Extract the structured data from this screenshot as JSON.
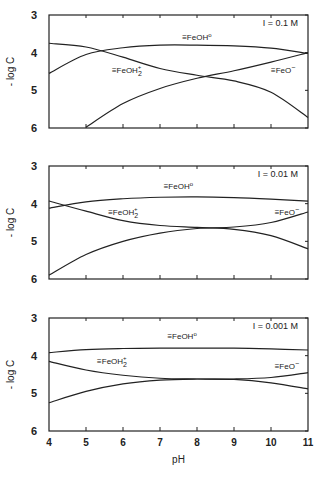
{
  "chart_data": [
    {
      "type": "line",
      "title": "I = 0.1 M",
      "xlabel": "pH",
      "ylabel": "- log C",
      "xlim": [
        4,
        11
      ],
      "ylim": [
        3,
        6
      ],
      "y_inverted": true,
      "yticks": [
        3,
        4,
        5,
        6
      ],
      "xticks": [
        4,
        5,
        6,
        7,
        8,
        9,
        10,
        11
      ],
      "grid": false,
      "x": [
        4,
        5,
        6,
        7,
        8,
        9,
        10,
        11
      ],
      "series": [
        {
          "name": "≡FeOH°",
          "values": [
            4.55,
            4.05,
            3.87,
            3.8,
            3.8,
            3.82,
            3.88,
            4.02
          ]
        },
        {
          "name": "≡FeOH2+",
          "values": [
            3.75,
            3.85,
            4.12,
            4.42,
            4.6,
            4.75,
            5.05,
            5.72
          ]
        },
        {
          "name": "≡FeO-",
          "values": [
            null,
            5.98,
            5.35,
            4.95,
            4.68,
            4.48,
            4.25,
            4.0
          ]
        }
      ],
      "labels": [
        {
          "text": "≡FeOH°",
          "x": 7.6,
          "y": 3.66
        },
        {
          "text": "≡FeOH2+",
          "x": 5.7,
          "y": 4.55
        },
        {
          "text": "≡FeO-",
          "x": 10.0,
          "y": 4.55
        }
      ]
    },
    {
      "type": "line",
      "title": "I = 0.01 M",
      "xlabel": "pH",
      "ylabel": "- log C",
      "xlim": [
        4,
        11
      ],
      "ylim": [
        3,
        6
      ],
      "y_inverted": true,
      "yticks": [
        3,
        4,
        5,
        6
      ],
      "xticks": [
        4,
        5,
        6,
        7,
        8,
        9,
        10,
        11
      ],
      "grid": false,
      "x": [
        4,
        5,
        6,
        7,
        8,
        9,
        10,
        11
      ],
      "series": [
        {
          "name": "≡FeOH°",
          "values": [
            4.12,
            3.95,
            3.87,
            3.83,
            3.82,
            3.84,
            3.88,
            3.93
          ]
        },
        {
          "name": "≡FeOH2+",
          "values": [
            3.93,
            4.2,
            4.45,
            4.58,
            4.63,
            4.68,
            4.85,
            5.2
          ]
        },
        {
          "name": "≡FeO-",
          "values": [
            5.9,
            5.35,
            5.0,
            4.78,
            4.66,
            4.62,
            4.5,
            4.22
          ]
        }
      ],
      "labels": [
        {
          "text": "≡FeOH°",
          "x": 7.1,
          "y": 3.6
        },
        {
          "text": "≡FeOH2+",
          "x": 5.6,
          "y": 4.3
        },
        {
          "text": "≡FeO-",
          "x": 10.1,
          "y": 4.3
        }
      ]
    },
    {
      "type": "line",
      "title": "I = 0.001 M",
      "xlabel": "pH",
      "ylabel": "- log C",
      "xlim": [
        4,
        11
      ],
      "ylim": [
        3,
        6
      ],
      "y_inverted": true,
      "yticks": [
        3,
        4,
        5,
        6
      ],
      "xticks": [
        4,
        5,
        6,
        7,
        8,
        9,
        10,
        11
      ],
      "xticklabels": [
        "4",
        "5",
        "6",
        "7",
        "8",
        "9",
        "10",
        "11"
      ],
      "grid": false,
      "x": [
        4,
        5,
        6,
        7,
        8,
        9,
        10,
        11
      ],
      "series": [
        {
          "name": "≡FeOH°",
          "values": [
            3.92,
            3.84,
            3.81,
            3.8,
            3.8,
            3.8,
            3.82,
            3.85
          ]
        },
        {
          "name": "≡FeOH2+",
          "values": [
            4.15,
            4.38,
            4.52,
            4.6,
            4.62,
            4.63,
            4.72,
            4.88
          ]
        },
        {
          "name": "≡FeO-",
          "values": [
            5.25,
            4.95,
            4.75,
            4.65,
            4.62,
            4.62,
            4.58,
            4.45
          ]
        }
      ],
      "labels": [
        {
          "text": "≡FeOH°",
          "x": 7.2,
          "y": 3.55
        },
        {
          "text": "≡FeOH2+",
          "x": 5.3,
          "y": 4.22
        },
        {
          "text": "≡FeO-",
          "x": 10.1,
          "y": 4.35
        }
      ]
    }
  ],
  "labels": {
    "ylabel": "- log C",
    "xlabel": "pH",
    "ions": [
      "I = 0.1 M",
      "I = 0.01 M",
      "I = 0.001 M"
    ]
  }
}
